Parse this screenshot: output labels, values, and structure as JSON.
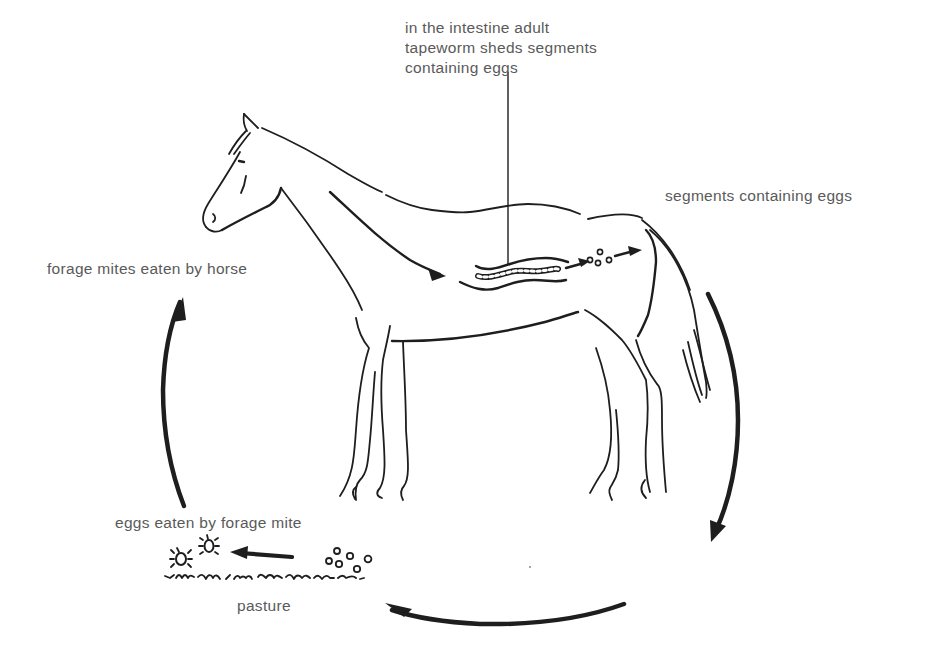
{
  "diagram": {
    "colors": {
      "ink": "#1e1e1e",
      "label_text": "#5a5a5a",
      "background": "#ffffff"
    },
    "labels": {
      "intestine": {
        "lines": [
          "in the intestine adult",
          "tapeworm sheds segments",
          "containing eggs"
        ]
      },
      "segments": "segments containing eggs",
      "forage_mites_eaten": "forage mites eaten by horse",
      "eggs_eaten": "eggs eaten by forage mite",
      "pasture": "pasture"
    },
    "stages": [
      {
        "id": 1,
        "name": "adult tapeworm in intestine sheds egg-bearing segments"
      },
      {
        "id": 2,
        "name": "segments containing eggs passed out"
      },
      {
        "id": 3,
        "name": "eggs on pasture"
      },
      {
        "id": 4,
        "name": "eggs eaten by forage mite"
      },
      {
        "id": 5,
        "name": "forage mites eaten by horse"
      }
    ],
    "icons": {
      "horse": "horse-outline-drawing",
      "tapeworm": "tapeworm-icon",
      "eggs": "egg-cluster-icon",
      "mites": "forage-mite-icon",
      "grass": "pasture-grass-line",
      "cycle_arrows": "cycle-arrow-icon"
    }
  }
}
